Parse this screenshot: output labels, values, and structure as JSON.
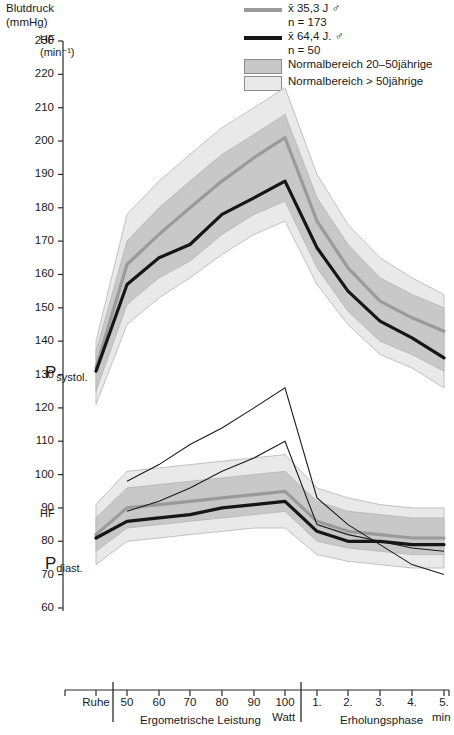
{
  "titles": {
    "y_axis_title": "Blutdruck\n(mmHg)",
    "hf_unit_top": "HF\n(min⁻¹)",
    "hf_label_mid": "HF",
    "p_systol": "P",
    "p_systol_sub": "systol.",
    "p_diast": "P",
    "p_diast_sub": "diast."
  },
  "legend": {
    "items": [
      {
        "kind": "line-grey",
        "color": "#9a9a9a",
        "label": "x̄ 35,3 J ♂\nn = 173"
      },
      {
        "kind": "line-dark",
        "color": "#161616",
        "label": "x̄ 64,4 J. ♂\nn = 50"
      },
      {
        "kind": "swatch-dark",
        "color": "#c8c8c8",
        "label": "Normalbereich 20–50jährige"
      },
      {
        "kind": "swatch-light",
        "color": "#e9e9e9",
        "label": "Normalbereich > 50jährige"
      }
    ]
  },
  "axis": {
    "y_ticks": [
      230,
      220,
      210,
      200,
      190,
      180,
      170,
      160,
      150,
      140,
      130,
      120,
      110,
      100,
      90,
      80,
      70,
      60
    ],
    "y_min": 60,
    "y_max": 230,
    "x_ticks": [
      "Ruhe",
      "50",
      "60",
      "70",
      "80",
      "90",
      "100",
      "1.",
      "2.",
      "3.",
      "4.",
      "5."
    ],
    "x_unit_watt": "Watt",
    "x_unit_min": "min",
    "section_left": "Ergometrische Leistung",
    "section_right": "Erholungsphase"
  },
  "chart_data": {
    "type": "line",
    "xlabel": "Ergometrische Leistung / Erholungsphase",
    "ylabel": "Blutdruck (mmHg)",
    "ylim": [
      60,
      230
    ],
    "grid": false,
    "legend_position": "top-right",
    "x": [
      "Ruhe",
      "50",
      "60",
      "70",
      "80",
      "90",
      "100",
      "1.",
      "2.",
      "3.",
      "4.",
      "5."
    ],
    "series": [
      {
        "name": "x̄ 35,3 J ♂ (n = 173) P systol.",
        "color": "#9a9a9a",
        "values": [
          132,
          163,
          172,
          180,
          188,
          195,
          201,
          176,
          162,
          152,
          147,
          143
        ]
      },
      {
        "name": "x̄ 64,4 J. ♂ (n = 50) P systol.",
        "color": "#161616",
        "values": [
          131,
          157,
          165,
          169,
          178,
          183,
          188,
          168,
          155,
          146,
          141,
          135
        ]
      },
      {
        "name": "x̄ 35,3 J ♂ (n = 173) P diast.",
        "color": "#9a9a9a",
        "values": [
          82,
          90,
          91,
          92,
          93,
          94,
          95,
          86,
          83,
          82,
          81,
          81
        ]
      },
      {
        "name": "x̄ 64,4 J. ♂ (n = 50) P diast.",
        "color": "#161616",
        "values": [
          81,
          86,
          87,
          88,
          90,
          91,
          92,
          83,
          80,
          80,
          79,
          79
        ]
      },
      {
        "name": "HF x̄ 35,3 J ♂ (n = 173)",
        "color": "#1a1a1a",
        "values": [
          null,
          98,
          103,
          109,
          114,
          120,
          126,
          93,
          85,
          79,
          73,
          70
        ]
      },
      {
        "name": "HF x̄ 64,4 J. ♂ (n = 50)",
        "color": "#1a1a1a",
        "values": [
          null,
          89,
          92,
          96,
          101,
          105,
          110,
          85,
          82,
          80,
          78,
          77
        ]
      }
    ],
    "bands": [
      {
        "name": "Normalbereich 20–50jährige P systol.",
        "color": "#c8c8c8",
        "upper": [
          137,
          170,
          180,
          188,
          196,
          202,
          208,
          183,
          169,
          159,
          154,
          150
        ],
        "lower": [
          125,
          151,
          159,
          164,
          172,
          178,
          182,
          162,
          149,
          140,
          136,
          131
        ]
      },
      {
        "name": "Normalbereich > 50jährige P systol.",
        "color": "#e9e9e9",
        "upper": [
          140,
          178,
          188,
          196,
          204,
          210,
          216,
          190,
          175,
          165,
          159,
          154
        ],
        "lower": [
          121,
          145,
          153,
          159,
          166,
          172,
          176,
          157,
          145,
          136,
          132,
          126
        ]
      },
      {
        "name": "Normalbereich 20–50jährige P diast.",
        "color": "#c8c8c8",
        "upper": [
          87,
          96,
          97,
          98,
          99,
          100,
          101,
          92,
          89,
          88,
          87,
          87
        ],
        "lower": [
          77,
          84,
          85,
          86,
          87,
          88,
          89,
          80,
          78,
          77,
          76,
          76
        ]
      },
      {
        "name": "Normalbereich > 50jährige P diast.",
        "color": "#e9e9e9",
        "upper": [
          91,
          101,
          102,
          103,
          104,
          105,
          106,
          96,
          93,
          91,
          90,
          90
        ],
        "lower": [
          73,
          80,
          81,
          82,
          83,
          84,
          84,
          76,
          74,
          73,
          72,
          72
        ]
      }
    ]
  }
}
